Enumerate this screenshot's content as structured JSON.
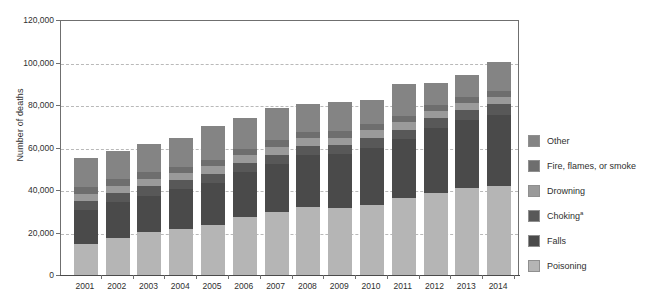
{
  "chart_data": {
    "type": "bar",
    "stacked": true,
    "title": "",
    "xlabel": "",
    "ylabel": "Number of deaths",
    "ylim": [
      0,
      120000
    ],
    "ytick_labels": [
      "0",
      "20,000",
      "40,000",
      "60,000",
      "80,000",
      "100,000",
      "120,000"
    ],
    "ytick_values": [
      0,
      20000,
      40000,
      60000,
      80000,
      100000,
      120000
    ],
    "grid": "horizontal-dashed",
    "legend_position": "right",
    "categories": [
      "2001",
      "2002",
      "2003",
      "2004",
      "2005",
      "2006",
      "2007",
      "2008",
      "2009",
      "2010",
      "2011",
      "2012",
      "2013",
      "2014"
    ],
    "series": [
      {
        "name": "Poisoning",
        "color": "#b5b5b5",
        "values": [
          14500,
          17500,
          20100,
          21800,
          23600,
          27500,
          29800,
          31800,
          31700,
          33000,
          36300,
          38800,
          40800,
          42000
        ]
      },
      {
        "name": "Falls",
        "color": "#4a4a4a",
        "values": [
          16000,
          16700,
          17300,
          18500,
          19700,
          20800,
          22600,
          24800,
          25100,
          26800,
          27500,
          30200,
          32000,
          33400
        ]
      },
      {
        "name": "Choking",
        "color": "#585858",
        "values": [
          4200,
          4300,
          4400,
          4200,
          4300,
          4400,
          4300,
          4300,
          4400,
          4500,
          4600,
          4700,
          4800,
          4900
        ]
      },
      {
        "name": "Drowning",
        "color": "#9a9a9a",
        "values": [
          3300,
          3400,
          3300,
          3300,
          3500,
          3600,
          3500,
          3500,
          3500,
          3800,
          3600,
          3600,
          3400,
          3400
        ]
      },
      {
        "name": "Fire, flames, or smoke",
        "color": "#6e6e6e",
        "values": [
          3300,
          3200,
          3200,
          3200,
          3200,
          3200,
          3200,
          3000,
          3000,
          2800,
          2700,
          2700,
          2700,
          2700
        ]
      },
      {
        "name": "Other",
        "color": "#848484",
        "values": [
          13700,
          13400,
          13200,
          13500,
          15700,
          14500,
          15100,
          13000,
          13500,
          11600,
          15300,
          10300,
          10500,
          13800
        ]
      }
    ],
    "totals": [
      55000,
      58500,
      61500,
      64500,
      70000,
      74000,
      78500,
      80400,
      81200,
      84500,
      90000,
      90300,
      94200,
      100200
    ]
  },
  "axis": {
    "y_title": "Number of deaths"
  },
  "legend": {
    "items": [
      {
        "label": "Other",
        "color": "#848484"
      },
      {
        "label": "Fire, flames, or smoke",
        "color": "#6e6e6e"
      },
      {
        "label": "Drowning",
        "color": "#9a9a9a"
      },
      {
        "label": "Choking",
        "superscript": "a",
        "color": "#585858"
      },
      {
        "label": "Falls",
        "color": "#4a4a4a"
      },
      {
        "label": "Poisoning",
        "color": "#b5b5b5"
      }
    ]
  }
}
